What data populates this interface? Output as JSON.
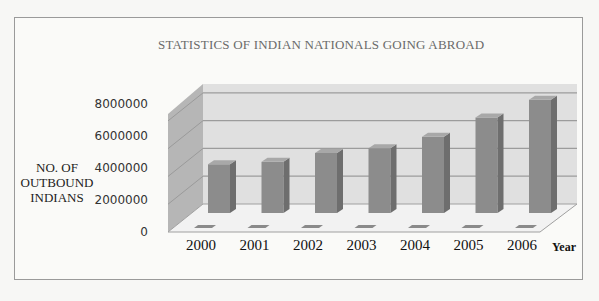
{
  "chart_data": {
    "type": "bar",
    "style": "3d-column",
    "title": "STATISTICS OF INDIAN NATIONALS GOING ABROAD",
    "xlabel": "Year",
    "ylabel": "NO. OF OUTBOUND INDIANS",
    "ylabel_lines": [
      "NO. OF",
      "OUTBOUND",
      "INDIANS"
    ],
    "categories": [
      "2000",
      "2001",
      "2002",
      "2003",
      "2004",
      "2005",
      "2006"
    ],
    "values": [
      4200000,
      4350000,
      4900000,
      5200000,
      5900000,
      7100000,
      8200000
    ],
    "ylim": [
      0,
      8000000
    ],
    "yticks": [
      "8000000",
      "6000000",
      "4000000",
      "2000000",
      "0"
    ],
    "grid": true,
    "legend": "none",
    "colors": {
      "bar_front": "#8c8c8c",
      "bar_side": "#6e6e6e",
      "bar_top": "#a8a8a8",
      "back_wall": "#dcdcdc",
      "side_wall": "#b4b4b4",
      "floor": "#f0f0f0",
      "gridline": "#9c9c9c"
    }
  }
}
